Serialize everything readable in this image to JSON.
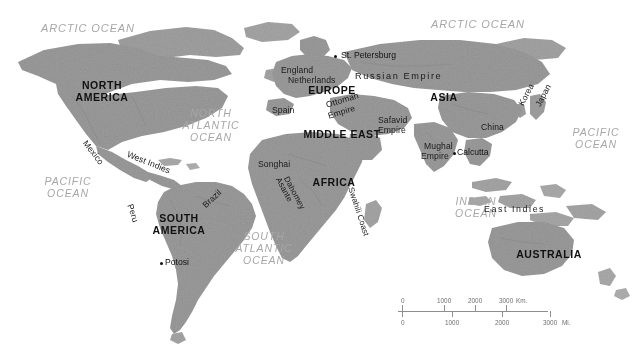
{
  "map": {
    "title": "World Map c. 1700",
    "colors": {
      "background": "#ffffff",
      "land": "#9b9b9b",
      "land_shadow": "#8a8a8a",
      "ocean_label": "#a7a7a7",
      "land_label": "#111111",
      "scale_line": "#8e8e8e",
      "scale_text": "#6f6f6f"
    },
    "oceans": [
      {
        "id": "arctic-ocean-west",
        "lines": [
          "ARCTIC OCEAN"
        ],
        "x": 28,
        "y": 22,
        "w": 120
      },
      {
        "id": "arctic-ocean-east",
        "lines": [
          "ARCTIC OCEAN"
        ],
        "x": 418,
        "y": 18,
        "w": 120
      },
      {
        "id": "north-atlantic-ocean",
        "lines": [
          "NORTH",
          "ATLANTIC",
          "OCEAN"
        ],
        "x": 168,
        "y": 108,
        "w": 86
      },
      {
        "id": "south-atlantic-ocean",
        "lines": [
          "SOUTH",
          "ATLANTIC",
          "OCEAN"
        ],
        "x": 228,
        "y": 231,
        "w": 72
      },
      {
        "id": "pacific-ocean-west",
        "lines": [
          "PACIFIC",
          "OCEAN"
        ],
        "x": 30,
        "y": 176,
        "w": 76
      },
      {
        "id": "pacific-ocean-east",
        "lines": [
          "PACIFIC",
          "OCEAN"
        ],
        "x": 558,
        "y": 127,
        "w": 76
      },
      {
        "id": "indian-ocean",
        "lines": [
          "INDIAN",
          "OCEAN"
        ],
        "x": 438,
        "y": 196,
        "w": 76
      }
    ],
    "continents": [
      {
        "id": "north-america",
        "lines": [
          "NORTH",
          "AMERICA"
        ],
        "x": 62,
        "y": 80,
        "w": 80
      },
      {
        "id": "south-america",
        "lines": [
          "SOUTH",
          "AMERICA"
        ],
        "x": 141,
        "y": 213,
        "w": 76
      },
      {
        "id": "europe",
        "lines": [
          "EUROPE"
        ],
        "x": 304,
        "y": 85,
        "w": 56
      },
      {
        "id": "asia",
        "lines": [
          "ASIA"
        ],
        "x": 424,
        "y": 92,
        "w": 40
      },
      {
        "id": "africa",
        "lines": [
          "AFRICA"
        ],
        "x": 307,
        "y": 177,
        "w": 54
      },
      {
        "id": "middle-east",
        "lines": [
          "MIDDLE EAST"
        ],
        "x": 300,
        "y": 129,
        "w": 84
      },
      {
        "id": "australia",
        "lines": [
          "AUSTRALIA"
        ],
        "x": 512,
        "y": 249,
        "w": 74
      }
    ],
    "places": [
      {
        "id": "england",
        "text": "England",
        "x": 281,
        "y": 66,
        "rot": 0,
        "size": 8.6
      },
      {
        "id": "netherlands",
        "text": "Netherlands",
        "x": 288,
        "y": 76,
        "rot": 0,
        "size": 8.6
      },
      {
        "id": "spain",
        "text": "Spain",
        "x": 272,
        "y": 106,
        "rot": 0,
        "size": 8.6
      },
      {
        "id": "russian-empire",
        "text": "Russian Empire",
        "x": 355,
        "y": 71,
        "rot": 0,
        "size": 9.2,
        "spaced": true
      },
      {
        "id": "ottoman-empire-line1",
        "text": "Ottoman",
        "x": 325,
        "y": 101,
        "rot": -17,
        "size": 8.6
      },
      {
        "id": "ottoman-empire-line2",
        "text": "Empire",
        "x": 327,
        "y": 112,
        "rot": -17,
        "size": 8.6
      },
      {
        "id": "safavid-empire-line1",
        "text": "Safavid",
        "x": 378,
        "y": 116,
        "rot": 0,
        "size": 8.6
      },
      {
        "id": "safavid-empire-line2",
        "text": "Empire",
        "x": 378,
        "y": 126,
        "rot": 0,
        "size": 8.6
      },
      {
        "id": "mughal-empire-line1",
        "text": "Mughal",
        "x": 424,
        "y": 142,
        "rot": 0,
        "size": 8.6
      },
      {
        "id": "mughal-empire-line2",
        "text": "Empire",
        "x": 421,
        "y": 152,
        "rot": 0,
        "size": 8.6
      },
      {
        "id": "china",
        "text": "China",
        "x": 481,
        "y": 123,
        "rot": 0,
        "size": 8.6
      },
      {
        "id": "korea",
        "text": "Korea",
        "x": 517,
        "y": 103,
        "rot": -62,
        "size": 8.6
      },
      {
        "id": "japan",
        "text": "Japan",
        "x": 534,
        "y": 104,
        "rot": -62,
        "size": 8.6
      },
      {
        "id": "east-indies",
        "text": "East Indies",
        "x": 484,
        "y": 205,
        "rot": 0,
        "size": 8.8,
        "spaced": true
      },
      {
        "id": "mexico",
        "text": "Mexico",
        "x": 88,
        "y": 139,
        "rot": 52,
        "size": 8.6
      },
      {
        "id": "west-indies",
        "text": "West Indies",
        "x": 129,
        "y": 150,
        "rot": 22,
        "size": 8.6
      },
      {
        "id": "peru",
        "text": "Peru",
        "x": 134,
        "y": 203,
        "rot": 72,
        "size": 8.6
      },
      {
        "id": "brazil",
        "text": "Brazil",
        "x": 201,
        "y": 203,
        "rot": -42,
        "size": 8.6
      },
      {
        "id": "songhai",
        "text": "Songhai",
        "x": 258,
        "y": 160,
        "rot": 0,
        "size": 8.6
      },
      {
        "id": "asante",
        "text": "Asante",
        "x": 282,
        "y": 176,
        "rot": 62,
        "size": 8.2
      },
      {
        "id": "dahomey",
        "text": "Dahomey",
        "x": 290,
        "y": 175,
        "rot": 62,
        "size": 8.2
      },
      {
        "id": "swahili-coast",
        "text": "Swahili Coast",
        "x": 355,
        "y": 186,
        "rot": 72,
        "size": 8.2
      }
    ],
    "cities": [
      {
        "id": "st-petersburg",
        "text": "St. Petersburg",
        "dot_x": 334,
        "dot_y": 55,
        "label_x": 341,
        "label_y": 51
      },
      {
        "id": "potosi",
        "text": "Potosi",
        "dot_x": 160,
        "dot_y": 262,
        "label_x": 165,
        "label_y": 258
      },
      {
        "id": "calcutta",
        "text": "Calcutta",
        "dot_x": 453,
        "dot_y": 152,
        "label_x": 457,
        "label_y": 148
      }
    ],
    "scale": {
      "km_unit": "Km.",
      "mi_unit": "Mi.",
      "km_labels": [
        "0",
        "1000",
        "2000",
        "3000"
      ],
      "mi_labels": [
        "0",
        "1000",
        "2000",
        "3000"
      ],
      "km_positions": [
        4,
        46,
        77,
        108
      ],
      "mi_positions": [
        4,
        54,
        104,
        152
      ]
    }
  }
}
